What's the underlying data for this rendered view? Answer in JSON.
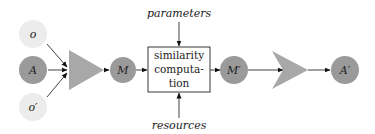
{
  "diagram": {
    "nodes": {
      "o": {
        "label": "o",
        "color": "#ececec"
      },
      "A": {
        "label": "A",
        "color": "#9a9a9a"
      },
      "o_prime": {
        "label": "o′",
        "color": "#ececec"
      },
      "M": {
        "label": "M",
        "color": "#9a9a9a"
      },
      "M_prime": {
        "label": "M′",
        "color": "#9a9a9a"
      },
      "A_prime": {
        "label": "A′",
        "color": "#9a9a9a"
      }
    },
    "process_box": {
      "line1": "similarity",
      "line2": "computa-",
      "line3": "tion"
    },
    "inputs": {
      "top": "parameters",
      "bottom": "resources"
    },
    "operators": {
      "combine_color": "#a8a8a8",
      "extract_color": "#a8a8a8"
    }
  }
}
